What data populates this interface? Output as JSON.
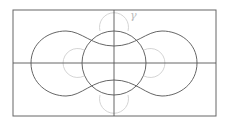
{
  "diagram": {
    "type": "geometric-figure",
    "frame": {
      "x": 13,
      "y": 10,
      "width": 203,
      "height": 106,
      "color": "#555555"
    },
    "axes": {
      "horizontal_y": 63,
      "vertical_x": 114,
      "color": "#444444"
    },
    "outer_curve": {
      "description": "peanut-shaped closed curve",
      "color": "#444444"
    },
    "central_circle": {
      "cx": 114,
      "cy": 63,
      "r": 32,
      "color": "#444444"
    },
    "small_circles": {
      "color": "#c8c8c8",
      "items": [
        {
          "name": "top",
          "cx": 114,
          "cy": 27,
          "r": 15
        },
        {
          "name": "bottom",
          "cx": 114,
          "cy": 99,
          "r": 15
        },
        {
          "name": "left",
          "cx": 81,
          "cy": 63,
          "r": 15
        },
        {
          "name": "right",
          "cx": 147,
          "cy": 63,
          "r": 15
        }
      ]
    },
    "labels": {
      "gamma": "γ"
    },
    "label_color": "#bbbbbb"
  }
}
